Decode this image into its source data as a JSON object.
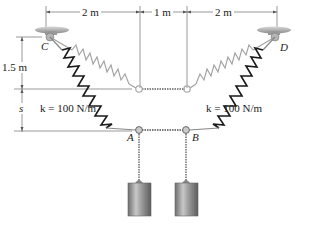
{
  "figure": {
    "dimensions": {
      "top_left": "2 m",
      "top_middle": "1 m",
      "top_right": "2 m",
      "vertical_upper": "1.5 m",
      "vertical_lower": "s"
    },
    "springs": {
      "left_stiffness": "k = 100 N/m",
      "right_stiffness": "k = 100 N/m"
    },
    "points": {
      "C": "C",
      "D": "D",
      "A": "A",
      "B": "B"
    },
    "masses": [
      "left-cylinder-weight",
      "right-cylinder-weight"
    ],
    "colors": {
      "stretched_spring": "#1a1a1a",
      "unstretched_spring": "#9a9a9a",
      "dimension_lines": "#555555",
      "cylinder": "#8a8a8a"
    }
  }
}
